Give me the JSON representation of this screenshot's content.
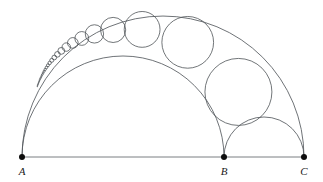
{
  "figure": {
    "background_color": "#ffffff",
    "stroke_color": "#555a5e",
    "dot_color": "#0d0d0d",
    "width": 323,
    "height": 182
  },
  "baseline": {
    "name": "segment-AC",
    "x1": 22,
    "y1": 157,
    "x2": 304,
    "y2": 157,
    "color": "#6b7074"
  },
  "vertices": [
    {
      "id": "A",
      "label": "A",
      "x": 22,
      "y": 157,
      "label_x": 22,
      "label_y": 175,
      "radius": 3.0
    },
    {
      "id": "B",
      "label": "B",
      "x": 224,
      "y": 157,
      "label_x": 224,
      "label_y": 175,
      "radius": 3.0
    },
    {
      "id": "C",
      "label": "C",
      "x": 304,
      "y": 157,
      "label_x": 304,
      "label_y": 175,
      "radius": 3.0
    }
  ],
  "semicircles": [
    {
      "id": "outer-AC",
      "name": "semicircle-AC",
      "cx": 163,
      "cy": 157,
      "r": 141
    },
    {
      "id": "inner-AB",
      "name": "semicircle-AB",
      "cx": 123,
      "cy": 157,
      "r": 101
    },
    {
      "id": "inner-BC",
      "name": "semicircle-BC",
      "cx": 264,
      "cy": 157,
      "r": 40
    }
  ],
  "chart_data": {
    "type": "scatter",
    "xlabel": "",
    "ylabel": "",
    "grid": false,
    "legend": "none",
    "xlim": [
      0,
      323
    ],
    "ylim": [
      0,
      182
    ],
    "baseline_points": {
      "A": [
        22,
        157
      ],
      "B": [
        224,
        157
      ],
      "C": [
        304,
        157
      ]
    },
    "semicircle_radii": {
      "AC": 141,
      "AB": 101,
      "BC": 40
    },
    "ratio_k": 0.716312,
    "pappus_chain": [
      {
        "n": 1,
        "cx": 238.42,
        "cy": 91.92,
        "r": 33.49
      },
      {
        "n": 2,
        "cx": 187.73,
        "cy": 42.33,
        "r": 25.86
      },
      {
        "n": 3,
        "cx": 142.12,
        "cy": 29.4,
        "r": 17.91
      },
      {
        "n": 4,
        "cx": 113.13,
        "cy": 29.95,
        "r": 12.58
      },
      {
        "n": 5,
        "cx": 94.43,
        "cy": 33.91,
        "r": 9.16
      },
      {
        "n": 6,
        "cx": 81.78,
        "cy": 38.46,
        "r": 6.9
      },
      {
        "n": 7,
        "cx": 72.84,
        "cy": 42.92,
        "r": 5.34
      },
      {
        "n": 8,
        "cx": 66.27,
        "cy": 47.08,
        "r": 4.23
      },
      {
        "n": 9,
        "cx": 61.28,
        "cy": 50.89,
        "r": 3.42
      },
      {
        "n": 10,
        "cx": 57.39,
        "cy": 54.35,
        "r": 2.81
      },
      {
        "n": 11,
        "cx": 54.28,
        "cy": 57.49,
        "r": 2.35
      },
      {
        "n": 12,
        "cx": 51.76,
        "cy": 60.33,
        "r": 1.99
      },
      {
        "n": 13,
        "cx": 49.67,
        "cy": 62.92,
        "r": 1.7
      },
      {
        "n": 14,
        "cx": 47.93,
        "cy": 65.28,
        "r": 1.47
      },
      {
        "n": 15,
        "cx": 46.45,
        "cy": 67.44,
        "r": 1.28
      },
      {
        "n": 16,
        "cx": 45.19,
        "cy": 69.43,
        "r": 1.13
      },
      {
        "n": 17,
        "cx": 44.09,
        "cy": 71.26,
        "r": 1.0
      },
      {
        "n": 18,
        "cx": 43.14,
        "cy": 72.95,
        "r": 0.89
      },
      {
        "n": 19,
        "cx": 42.31,
        "cy": 74.52,
        "r": 0.79
      },
      {
        "n": 20,
        "cx": 41.57,
        "cy": 75.98,
        "r": 0.71
      },
      {
        "n": 21,
        "cx": 40.91,
        "cy": 77.34,
        "r": 0.65
      },
      {
        "n": 22,
        "cx": 40.33,
        "cy": 78.61,
        "r": 0.59
      },
      {
        "n": 23,
        "cx": 39.81,
        "cy": 79.81,
        "r": 0.54
      },
      {
        "n": 24,
        "cx": 39.33,
        "cy": 80.93,
        "r": 0.49
      },
      {
        "n": 25,
        "cx": 38.9,
        "cy": 81.98,
        "r": 0.45
      },
      {
        "n": 26,
        "cx": 38.51,
        "cy": 82.98,
        "r": 0.42
      },
      {
        "n": 27,
        "cx": 38.15,
        "cy": 83.92,
        "r": 0.39
      },
      {
        "n": 28,
        "cx": 37.83,
        "cy": 84.82,
        "r": 0.36
      },
      {
        "n": 29,
        "cx": 37.53,
        "cy": 85.67,
        "r": 0.34
      },
      {
        "n": 30,
        "cx": 37.25,
        "cy": 86.48,
        "r": 0.32
      }
    ],
    "bc_tangent_circle": {
      "cx": 264,
      "cy": 117,
      "r": 40,
      "note": "semicircle over BC"
    }
  },
  "labels": {
    "A": "A",
    "B": "B",
    "C": "C"
  }
}
